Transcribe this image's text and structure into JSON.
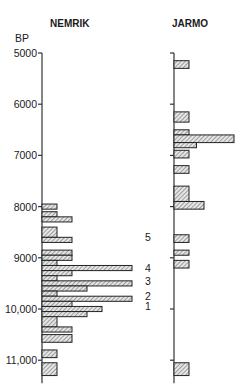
{
  "chart_data": [
    {
      "type": "bar",
      "orientation": "horizontal-histogram",
      "title": "NEMRIK",
      "ylabel": "BP",
      "ylim": [
        5000,
        11500
      ],
      "y_ticks": [
        "5000",
        "6000",
        "7000",
        "8000",
        "9000",
        "10,000",
        "11,000"
      ],
      "bin_width_years": 100,
      "bars": [
        {
          "from": 7950,
          "to": 8050,
          "count": 2
        },
        {
          "from": 8100,
          "to": 8200,
          "count": 2
        },
        {
          "from": 8200,
          "to": 8300,
          "count": 4
        },
        {
          "from": 8400,
          "to": 8600,
          "count": 2
        },
        {
          "from": 8600,
          "to": 8700,
          "count": 4
        },
        {
          "from": 8850,
          "to": 8950,
          "count": 4
        },
        {
          "from": 8950,
          "to": 9050,
          "count": 4
        },
        {
          "from": 9050,
          "to": 9150,
          "count": 2
        },
        {
          "from": 9150,
          "to": 9250,
          "count": 12
        },
        {
          "from": 9250,
          "to": 9350,
          "count": 4
        },
        {
          "from": 9350,
          "to": 9450,
          "count": 2
        },
        {
          "from": 9450,
          "to": 9550,
          "count": 12
        },
        {
          "from": 9550,
          "to": 9650,
          "count": 6
        },
        {
          "from": 9650,
          "to": 9750,
          "count": 2
        },
        {
          "from": 9750,
          "to": 9850,
          "count": 12
        },
        {
          "from": 9850,
          "to": 9950,
          "count": 4
        },
        {
          "from": 9950,
          "to": 10050,
          "count": 8
        },
        {
          "from": 10050,
          "to": 10150,
          "count": 6
        },
        {
          "from": 10150,
          "to": 10350,
          "count": 2
        },
        {
          "from": 10350,
          "to": 10450,
          "count": 4
        },
        {
          "from": 10500,
          "to": 10650,
          "count": 4
        },
        {
          "from": 10800,
          "to": 10950,
          "count": 2
        },
        {
          "from": 11050,
          "to": 11300,
          "count": 2
        }
      ],
      "annotations": [
        {
          "label": "5",
          "at": 8600
        },
        {
          "label": "4",
          "at": 9200
        },
        {
          "label": "3",
          "at": 9450
        },
        {
          "label": "2",
          "at": 9750
        },
        {
          "label": "1",
          "at": 9950
        }
      ]
    },
    {
      "type": "bar",
      "orientation": "horizontal-histogram",
      "title": "JARMO",
      "ylim": [
        5000,
        11500
      ],
      "y_ticks_unlabeled": [
        5000,
        6000,
        7000,
        8000,
        9000,
        10000,
        11000
      ],
      "bin_width_years": 100,
      "bars": [
        {
          "from": 5150,
          "to": 5300,
          "count": 2
        },
        {
          "from": 6150,
          "to": 6350,
          "count": 2
        },
        {
          "from": 6500,
          "to": 6600,
          "count": 2
        },
        {
          "from": 6600,
          "to": 6750,
          "count": 8
        },
        {
          "from": 6750,
          "to": 6850,
          "count": 3
        },
        {
          "from": 6900,
          "to": 7050,
          "count": 2
        },
        {
          "from": 7200,
          "to": 7350,
          "count": 2
        },
        {
          "from": 7600,
          "to": 7900,
          "count": 2
        },
        {
          "from": 7900,
          "to": 8050,
          "count": 4
        },
        {
          "from": 8550,
          "to": 8700,
          "count": 2
        },
        {
          "from": 8850,
          "to": 8950,
          "count": 2
        },
        {
          "from": 9050,
          "to": 9200,
          "count": 2
        },
        {
          "from": 11050,
          "to": 11300,
          "count": 2
        }
      ]
    }
  ],
  "layout": {
    "y0": 5000,
    "y0_px": 53,
    "px_per_1000": 51.2,
    "unit_px": 15,
    "nemrik_axis_x": 42,
    "jarmo_axis_x": 174,
    "axis_bottom_year": 11450
  },
  "labels": {
    "nemrik_title": "NEMRIK",
    "jarmo_title": "JARMO",
    "bp": "BP"
  }
}
